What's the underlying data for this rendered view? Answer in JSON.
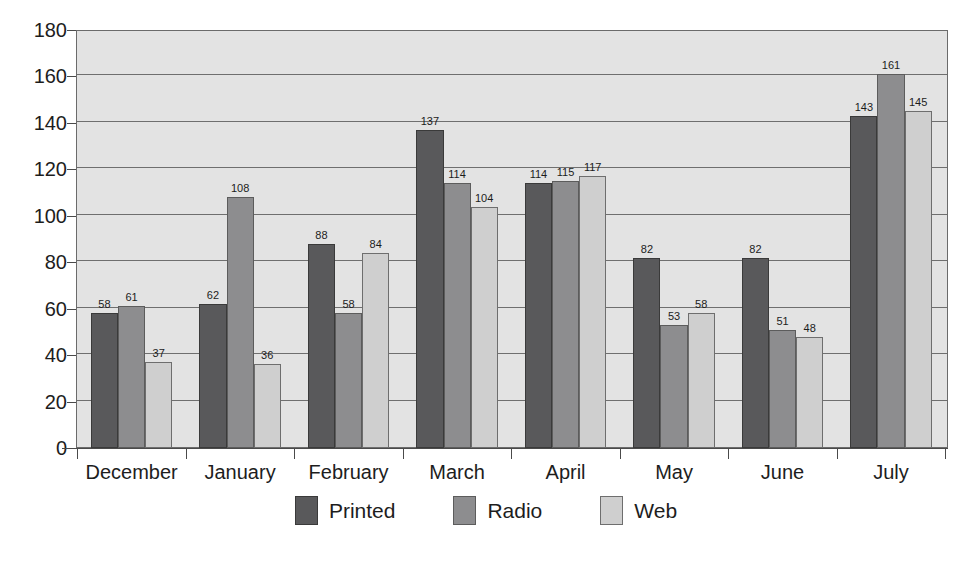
{
  "chart_data": {
    "type": "bar",
    "title": "",
    "subtitle": "",
    "xlabel": "",
    "ylabel": "",
    "grid": true,
    "legend_position": "bottom",
    "ylim": [
      0,
      180
    ],
    "ytick_step": 20,
    "yticks": [
      0,
      20,
      40,
      60,
      80,
      100,
      120,
      140,
      160,
      180
    ],
    "categories": [
      "December",
      "January",
      "February",
      "March",
      "April",
      "May",
      "June",
      "July"
    ],
    "series": [
      {
        "name": "Printed",
        "color": "#59595b",
        "values": [
          58,
          62,
          88,
          137,
          114,
          82,
          82,
          143
        ]
      },
      {
        "name": "Radio",
        "color": "#8d8d8f",
        "values": [
          61,
          108,
          58,
          114,
          115,
          53,
          51,
          161
        ]
      },
      {
        "name": "Web",
        "color": "#cfcfcf",
        "values": [
          37,
          36,
          84,
          104,
          117,
          58,
          48,
          145
        ]
      }
    ]
  },
  "style": {
    "plot_background": "#e3e3e3",
    "axis_color": "#4a4a4a",
    "grid_color": "#6f6f6f",
    "page_background": "#ffffff"
  }
}
